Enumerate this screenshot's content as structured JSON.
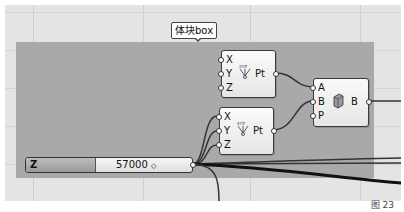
{
  "canvas": {
    "background": "#e4e4e4",
    "group_color": "#a9a9a9"
  },
  "group": {
    "label": "体块box"
  },
  "nodes": {
    "pt_top": {
      "inputs": [
        "X",
        "Y",
        "Z"
      ],
      "icon": "construct-point-icon",
      "output": "Pt"
    },
    "pt_bottom": {
      "inputs": [
        "X",
        "Y",
        "Z"
      ],
      "icon": "construct-point-icon",
      "output": "Pt"
    },
    "box": {
      "inputs": [
        "A",
        "B",
        "P"
      ],
      "icon": "box-icon",
      "output": "B"
    }
  },
  "slider": {
    "name": "Z coordinate",
    "value": "57000",
    "marker": "◇"
  },
  "caption": "图 23"
}
